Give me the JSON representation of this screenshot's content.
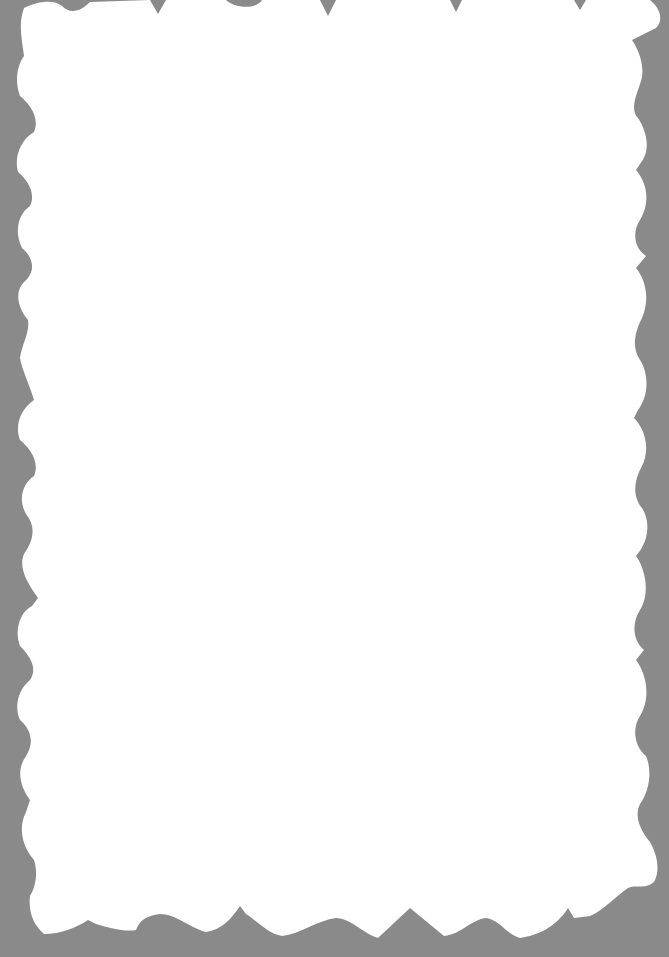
{
  "scene": {
    "description": "Blank white sheet of paper with wavy scalloped edges on a gray background",
    "background_color": "#8a8a8a",
    "paper_color": "#ffffff",
    "text_content": []
  }
}
